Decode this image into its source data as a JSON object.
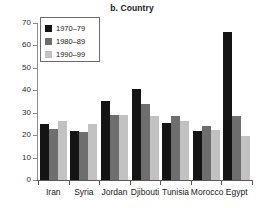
{
  "chart_data": {
    "type": "bar",
    "title": "b. Country",
    "xlabel": "",
    "ylabel": "",
    "ylim": [
      0,
      70
    ],
    "yticks": [
      0,
      10,
      20,
      30,
      40,
      50,
      60,
      70
    ],
    "grid": false,
    "legend_position": "top-left",
    "categories": [
      "Iran",
      "Syria",
      "Jordan",
      "Djibouti",
      "Tunisia",
      "Morocco",
      "Egypt"
    ],
    "series": [
      {
        "name": "1970–79",
        "color": "#141414",
        "values": [
          25,
          22,
          35.2,
          40.4,
          25.6,
          21.7,
          66.2
        ]
      },
      {
        "name": "1980–89",
        "color": "#6e6e6e",
        "values": [
          22.6,
          21.4,
          29.2,
          33.8,
          28.5,
          24.2,
          28.5
        ]
      },
      {
        "name": "1990–99",
        "color": "#c2c2c2",
        "values": [
          26.4,
          25,
          29,
          28.4,
          26.4,
          22.2,
          19.5
        ]
      }
    ]
  }
}
